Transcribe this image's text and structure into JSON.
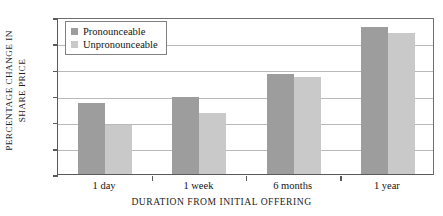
{
  "chart_data": {
    "type": "bar",
    "title": "",
    "xlabel": "DURATION FROM INITIAL OFFERING",
    "ylabel_line1": "PERCENTAGE CHANGE IN",
    "ylabel_line2": "SHARE PRICE",
    "categories": [
      "1 day",
      "1 week",
      "6 months",
      "1 year"
    ],
    "series": [
      {
        "name": "Pronounceable",
        "color": "#9d9d9d",
        "values": [
          13.5,
          14.7,
          19.2,
          28.1
        ]
      },
      {
        "name": "Unpronounceable",
        "color": "#c9c9c9",
        "values": [
          9.4,
          11.7,
          18.6,
          26.9
        ]
      }
    ],
    "ylim": [
      0,
      30
    ],
    "yticks": [
      0,
      5,
      10,
      15,
      20,
      25,
      30
    ],
    "ytick_labels": [
      "0",
      "5",
      "10",
      "15",
      "20",
      "25",
      "30"
    ],
    "grid": true,
    "grid_axis": "y",
    "legend_position": "upper-left-inside"
  }
}
